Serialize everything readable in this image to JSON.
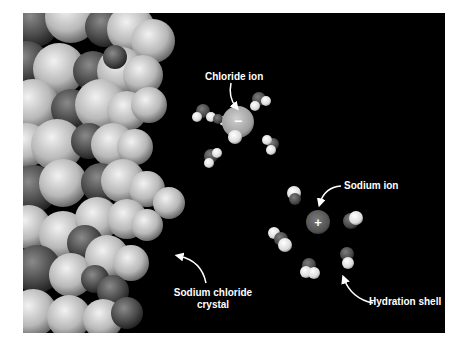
{
  "figure": {
    "background": "#000000",
    "labels": {
      "chloride_ion": "Chloride ion",
      "sodium_ion": "Sodium ion",
      "crystal_line1": "Sodium chloride",
      "crystal_line2": "crystal",
      "hydration_shell": "Hydration shell"
    },
    "ion_signs": {
      "chloride": "−",
      "sodium": "+"
    },
    "colors": {
      "chloride_atom": "#bdbdbd",
      "sodium_atom": "#6a6a6a",
      "oxygen_atom": "#5a5a5a",
      "hydrogen_atom": "#f0f0f0",
      "label_text": "#ffffff"
    }
  }
}
